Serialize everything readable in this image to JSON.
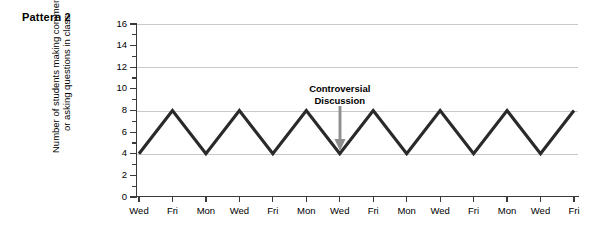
{
  "panel": {
    "title": "Pattern 2"
  },
  "chart_data": {
    "type": "line",
    "title": "Pattern 2",
    "xlabel": "",
    "ylabel": "Number of students making comments or asking questions in class",
    "ylabel_lines": [
      "Number of students making comments",
      "or asking questions in class"
    ],
    "categories": [
      "Wed",
      "Fri",
      "Mon",
      "Wed",
      "Fri",
      "Mon",
      "Wed",
      "Fri",
      "Mon",
      "Wed",
      "Fri",
      "Mon",
      "Wed",
      "Fri"
    ],
    "values": [
      4,
      8,
      4,
      8,
      4,
      8,
      4,
      8,
      4,
      8,
      4,
      8,
      4,
      8
    ],
    "ylim": [
      0,
      16
    ],
    "yticks": [
      0,
      2,
      4,
      6,
      8,
      10,
      12,
      14,
      16
    ],
    "yticks_minor": [
      1,
      3,
      5,
      7,
      9,
      11,
      13,
      15
    ],
    "ytick_labels": [
      "0",
      "2",
      "4",
      "6",
      "8",
      "10",
      "12",
      "14",
      "16"
    ],
    "gridlines": [
      4,
      8,
      12,
      16
    ],
    "grid": true,
    "legend": "none",
    "series_color": "#2a2a2a",
    "grid_color": "#c9c9c9",
    "axis_color": "#3a3a3a",
    "annotations": [
      {
        "text": "Controversial Discussion",
        "lines": [
          "Controversial",
          "Discussion"
        ],
        "points_to_category_index": 6,
        "points_to_value": 4,
        "arrow_color": "#8e8e8e"
      }
    ]
  }
}
